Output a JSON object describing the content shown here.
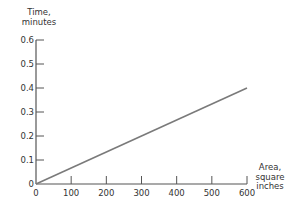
{
  "chart_data": {
    "type": "line",
    "title": "",
    "xlabel": "Area, square inches",
    "xlabel_lines": [
      "Area,",
      "square",
      "inches"
    ],
    "ylabel": "Time, minutes",
    "ylabel_lines": [
      "Time,",
      "minutes"
    ],
    "x_ticks": [
      0,
      100,
      200,
      300,
      400,
      500,
      600
    ],
    "x_tick_labels": [
      "0",
      "100",
      "200",
      "300",
      "400",
      "500",
      "600"
    ],
    "y_ticks": [
      0,
      0.1,
      0.2,
      0.3,
      0.4,
      0.5,
      0.6
    ],
    "y_tick_labels": [
      "0",
      "0.1",
      "0.2",
      "0.3",
      "0.4",
      "0.5",
      "0.6"
    ],
    "xlim": [
      0,
      600
    ],
    "ylim": [
      0,
      0.6
    ],
    "grid": false,
    "legend": null,
    "series": [
      {
        "name": "Time vs Area",
        "x": [
          0,
          600
        ],
        "y": [
          0,
          0.4
        ],
        "color": "#7a7a7a"
      }
    ]
  },
  "colors": {
    "axis": "#555555",
    "line": "#7a7a7a",
    "text": "#333333"
  }
}
